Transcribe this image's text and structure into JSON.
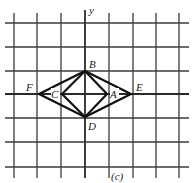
{
  "figure": {
    "caption": "(c)",
    "axis_label_y": "y",
    "grid": {
      "vertical_x": [
        14,
        37,
        61,
        109,
        133,
        156,
        179
      ],
      "horizontal_y": [
        23,
        47,
        71,
        118,
        142,
        167
      ],
      "x_axis_y": 94,
      "y_axis_x": 85
    },
    "points": {
      "A": {
        "label": "A",
        "x": 107,
        "y": 94
      },
      "B": {
        "label": "B",
        "x": 85,
        "y": 71
      },
      "C": {
        "label": "C",
        "x": 62,
        "y": 94
      },
      "D": {
        "label": "D",
        "x": 85,
        "y": 117
      },
      "E": {
        "label": "E",
        "x": 131,
        "y": 94
      },
      "F": {
        "label": "F",
        "x": 39,
        "y": 94
      }
    },
    "shapes": [
      {
        "name": "inner-rhombus",
        "vertices": [
          "A",
          "B",
          "C",
          "D"
        ]
      },
      {
        "name": "outer-rhombus",
        "vertices": [
          "E",
          "B",
          "F",
          "D"
        ]
      }
    ],
    "colors": {
      "grid": "#3a3a3a",
      "figure": "#111111",
      "background": "#ffffff"
    }
  }
}
